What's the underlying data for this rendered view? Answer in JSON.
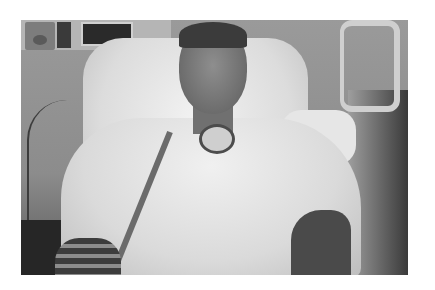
{
  "image": {
    "description": "Grayscale photograph of a person seated in a hospital bed/chair wearing a patterned hospital gown, with a tracheostomy tube at the neck and medical equipment on the wall behind",
    "style": "black-and-white photograph on white background",
    "elements": [
      "wall-mounted medical panels",
      "padded hospital chair back",
      "bed rail at right",
      "pillow",
      "hospital gown",
      "tracheostomy tube with tubing",
      "cables on left wall",
      "bandaged left forearm"
    ],
    "colors": {
      "background": "#ffffff",
      "wall": "#8c8c8c",
      "gown": "#e0e0e0",
      "shadow": "#262626"
    }
  }
}
